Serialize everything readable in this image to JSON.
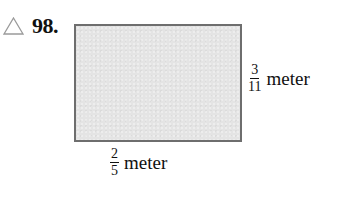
{
  "problem": {
    "icon": "triangle-outline-icon",
    "number": "98."
  },
  "figure": {
    "shape": "rectangle",
    "fill_color": "#e4e4e4",
    "border_color": "#6e6e6e",
    "height_label": {
      "numerator": "3",
      "denominator": "11",
      "unit": "meter"
    },
    "width_label": {
      "numerator": "2",
      "denominator": "5",
      "unit": "meter"
    }
  }
}
